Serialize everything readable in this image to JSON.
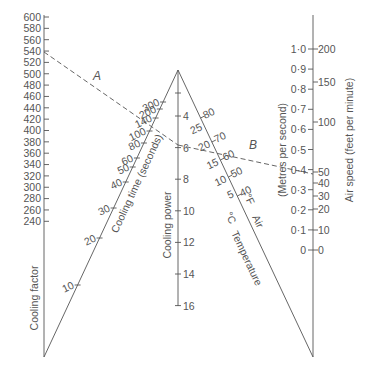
{
  "axes": {
    "cooling_factor": {
      "label": "Cooling factor",
      "ticks": [
        "600",
        "580",
        "560",
        "540",
        "520",
        "500",
        "480",
        "460",
        "440",
        "420",
        "400",
        "380",
        "360",
        "340",
        "320",
        "300",
        "280",
        "260",
        "240"
      ]
    },
    "cooling_time": {
      "label": "Cooling time (seconds)",
      "ticks": [
        "300",
        "200",
        "140",
        "100",
        "80",
        "60",
        "50",
        "40",
        "30",
        "20",
        "10"
      ]
    },
    "cooling_power": {
      "label": "Cooling power",
      "ticks": [
        "4",
        "6",
        "8",
        "10",
        "12",
        "14",
        "16"
      ]
    },
    "temperature": {
      "label": "Temperature",
      "sub_label_c": "°C",
      "sub_label_f": "°F",
      "sub_label_air": "Air",
      "celsius_ticks": [
        "25",
        "20",
        "15",
        "10",
        "5"
      ],
      "fahrenheit_ticks": [
        "80",
        "70",
        "60",
        "50",
        "40"
      ]
    },
    "air_speed": {
      "label_metric": "(Metres per second)",
      "label_imperial": "Air speed (feet per minute)",
      "metric_ticks": [
        "1·0",
        "0·9",
        "0·8",
        "0·7",
        "0·6",
        "0·5",
        "0·4",
        "0·3",
        "0·2",
        "0·1",
        "0"
      ],
      "imperial_ticks": [
        "200",
        "150",
        "100",
        "50",
        "40",
        "30",
        "20",
        "10",
        "0"
      ]
    }
  },
  "annotations": {
    "line_a": "A",
    "line_b": "B"
  },
  "chart_data": {
    "type": "nomogram",
    "title": "",
    "scales": [
      {
        "name": "Cooling factor",
        "min": 240,
        "max": 600,
        "step": 20
      },
      {
        "name": "Cooling time (seconds)",
        "values": [
          10,
          20,
          30,
          40,
          50,
          60,
          80,
          100,
          140,
          200,
          300
        ]
      },
      {
        "name": "Cooling power",
        "min": 4,
        "max": 16,
        "step": 2
      },
      {
        "name": "Temperature °C",
        "values": [
          5,
          10,
          15,
          20,
          25
        ]
      },
      {
        "name": "Temperature °F",
        "values": [
          40,
          50,
          60,
          70,
          80
        ]
      },
      {
        "name": "Air speed (m/s)",
        "min": 0,
        "max": 1.0,
        "step": 0.1
      },
      {
        "name": "Air speed (ft/min)",
        "values": [
          0,
          10,
          20,
          30,
          40,
          50,
          100,
          150,
          200
        ]
      }
    ],
    "example_lines": [
      {
        "label": "A",
        "from": {
          "scale": "Cooling factor",
          "value": 540
        },
        "through": {
          "scale": "Cooling time (seconds)",
          "value": 100
        },
        "to": {
          "scale": "Cooling power",
          "value": 6
        }
      },
      {
        "label": "B",
        "from": {
          "scale": "Cooling power",
          "value": 6
        },
        "through": {
          "scale": "Temperature °F",
          "value": 60
        },
        "to": {
          "scale": "Air speed (ft/min)",
          "value": 50
        }
      }
    ]
  }
}
